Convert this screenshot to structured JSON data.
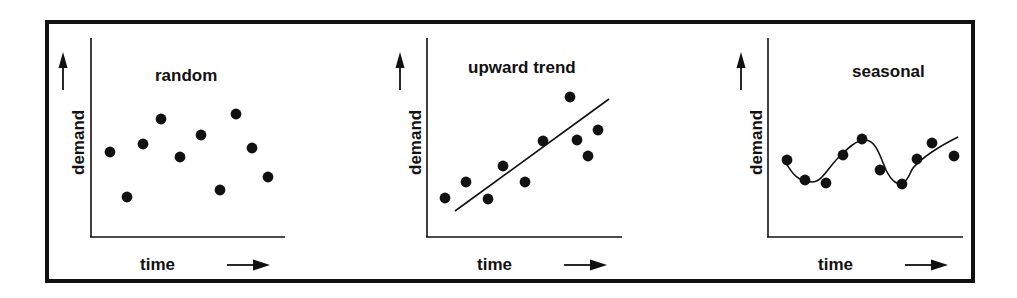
{
  "figure": {
    "background_color": "#ffffff",
    "ink_color": "#111111",
    "frame": {
      "x": 45,
      "y": 20,
      "width": 930,
      "height": 263,
      "border_width": 4
    }
  },
  "chart_data": [
    {
      "type": "scatter",
      "title": "random",
      "xlabel": "time",
      "ylabel": "demand",
      "grid": false,
      "legend": null,
      "axis_arrows": {
        "x": "right-arrow",
        "y": "up-arrow"
      },
      "axes": {
        "origin_x": 91,
        "origin_y": 237,
        "x_end": 285,
        "y_top": 38
      },
      "tick_labels": {
        "x": [],
        "y": []
      },
      "xlim": [
        0,
        11
      ],
      "ylim": [
        0,
        10
      ],
      "points": [
        {
          "x": 1,
          "y": 5.3
        },
        {
          "x": 2,
          "y": 2.6
        },
        {
          "x": 3,
          "y": 5.8
        },
        {
          "x": 4,
          "y": 7.3
        },
        {
          "x": 5,
          "y": 5.0
        },
        {
          "x": 6,
          "y": 6.3
        },
        {
          "x": 7,
          "y": 3.0
        },
        {
          "x": 8,
          "y": 7.6
        },
        {
          "x": 9,
          "y": 5.5
        },
        {
          "x": 10,
          "y": 3.8
        }
      ],
      "pixel_points": [
        [
          110,
          152
        ],
        [
          127,
          197
        ],
        [
          143,
          144
        ],
        [
          161,
          119
        ],
        [
          180,
          157
        ],
        [
          201,
          135
        ],
        [
          220,
          190
        ],
        [
          236,
          114
        ],
        [
          252,
          148
        ],
        [
          268,
          177
        ]
      ],
      "trend_line": null
    },
    {
      "type": "scatter",
      "title": "upward trend",
      "xlabel": "time",
      "ylabel": "demand",
      "grid": false,
      "legend": null,
      "axis_arrows": {
        "x": "right-arrow",
        "y": "up-arrow"
      },
      "axes": {
        "origin_x": 427,
        "origin_y": 237,
        "x_end": 622,
        "y_top": 38
      },
      "tick_labels": {
        "x": [],
        "y": []
      },
      "xlim": [
        0,
        11
      ],
      "ylim": [
        0,
        10
      ],
      "points": [
        {
          "x": 1,
          "y": 2.3
        },
        {
          "x": 2,
          "y": 3.2
        },
        {
          "x": 3,
          "y": 2.2
        },
        {
          "x": 4,
          "y": 4.1
        },
        {
          "x": 5,
          "y": 3.2
        },
        {
          "x": 6,
          "y": 5.5
        },
        {
          "x": 7,
          "y": 8.0
        },
        {
          "x": 8,
          "y": 5.6
        },
        {
          "x": 9,
          "y": 4.7
        },
        {
          "x": 10,
          "y": 6.2
        }
      ],
      "pixel_points": [
        [
          445,
          198
        ],
        [
          466,
          182
        ],
        [
          488,
          199
        ],
        [
          503,
          166
        ],
        [
          525,
          182
        ],
        [
          543,
          141
        ],
        [
          570,
          97
        ],
        [
          577,
          140
        ],
        [
          588,
          156
        ],
        [
          598,
          130
        ]
      ],
      "trend_line": {
        "x1": 455,
        "y1": 211,
        "x2": 609,
        "y2": 99
      }
    },
    {
      "type": "scatter",
      "title": "seasonal",
      "xlabel": "time",
      "ylabel": "demand",
      "grid": false,
      "legend": null,
      "axis_arrows": {
        "x": "right-arrow",
        "y": "up-arrow"
      },
      "axes": {
        "origin_x": 768,
        "origin_y": 237,
        "x_end": 963,
        "y_top": 38
      },
      "tick_labels": {
        "x": [],
        "y": []
      },
      "xlim": [
        0,
        11
      ],
      "ylim": [
        0,
        10
      ],
      "points": [
        {
          "x": 1,
          "y": 4.7
        },
        {
          "x": 2,
          "y": 3.4
        },
        {
          "x": 3,
          "y": 3.2
        },
        {
          "x": 4,
          "y": 5.1
        },
        {
          "x": 5,
          "y": 6.3
        },
        {
          "x": 6,
          "y": 4.1
        },
        {
          "x": 7,
          "y": 3.1
        },
        {
          "x": 8,
          "y": 4.8
        },
        {
          "x": 9,
          "y": 6.1
        },
        {
          "x": 10,
          "y": 5.0
        }
      ],
      "pixel_points": [
        [
          787,
          160
        ],
        [
          805,
          180
        ],
        [
          826,
          183
        ],
        [
          843,
          155
        ],
        [
          862,
          139
        ],
        [
          880,
          170
        ],
        [
          902,
          184
        ],
        [
          917,
          159
        ],
        [
          932,
          143
        ],
        [
          954,
          156
        ]
      ],
      "wave_path": "M 783 157 C 792 176, 800 182, 812 182 C 822 182, 828 168, 838 158 C 848 148, 856 140, 866 140 C 876 141, 880 156, 886 170 C 892 182, 898 186, 904 182 C 909 179, 910 172, 913 168 C 920 160, 936 148, 958 137"
    }
  ],
  "panels": [
    {
      "name": "random",
      "title": "random",
      "title_pos": {
        "left": 155,
        "top": 67
      },
      "time_label": "time",
      "time_label_pos": {
        "left": 140,
        "top": 256
      },
      "time_arrow_pos": {
        "left": 227,
        "top": 264
      },
      "demand_label": "demand",
      "demand_label_pos": {
        "left": 70,
        "top": 175
      },
      "demand_arrow_pos": {
        "left": 63,
        "top": 58
      }
    },
    {
      "name": "upward",
      "title": "upward trend",
      "title_pos": {
        "left": 468,
        "top": 59
      },
      "time_label": "time",
      "time_label_pos": {
        "left": 477,
        "top": 256
      },
      "time_arrow_pos": {
        "left": 564,
        "top": 264
      },
      "demand_label": "demand",
      "demand_label_pos": {
        "left": 407,
        "top": 175
      },
      "demand_arrow_pos": {
        "left": 400,
        "top": 58
      }
    },
    {
      "name": "seasonal",
      "title": "seasonal",
      "title_pos": {
        "left": 852,
        "top": 63
      },
      "time_label": "time",
      "time_label_pos": {
        "left": 818,
        "top": 256
      },
      "time_arrow_pos": {
        "left": 905,
        "top": 264
      },
      "demand_label": "demand",
      "demand_label_pos": {
        "left": 748,
        "top": 175
      },
      "demand_arrow_pos": {
        "left": 741,
        "top": 58
      }
    }
  ]
}
